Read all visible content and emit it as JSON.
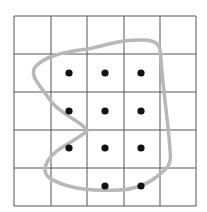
{
  "diagram": {
    "type": "grid-with-closed-curve",
    "grid": {
      "rows": 5,
      "cols": 5,
      "x_lines": [
        14,
        51,
        87,
        124,
        160,
        196
      ],
      "y_lines": [
        16,
        54,
        92,
        130,
        168,
        206
      ],
      "line_color": "#555555"
    },
    "dots": [
      {
        "x": 69,
        "y": 73
      },
      {
        "x": 105,
        "y": 73
      },
      {
        "x": 141,
        "y": 73
      },
      {
        "x": 69,
        "y": 111
      },
      {
        "x": 105,
        "y": 111
      },
      {
        "x": 141,
        "y": 111
      },
      {
        "x": 69,
        "y": 148
      },
      {
        "x": 105,
        "y": 148
      },
      {
        "x": 141,
        "y": 148
      },
      {
        "x": 105,
        "y": 186
      },
      {
        "x": 141,
        "y": 186
      }
    ],
    "dot_color": "#111111",
    "dot_count": 11,
    "curve": {
      "color": "#b8b8b8",
      "path": "M 88 49 C 110 44, 125 39, 145 40 C 162 41, 160 50, 161 60 C 163 90, 168 120, 170 150 C 172 165, 168 168, 155 178 C 145 186, 135 189, 120 190 C 100 191, 80 190, 65 185 C 50 180, 42 175, 46 165 C 50 150, 75 142, 87 131 C 84 122, 60 115, 50 100 C 40 85, 28 75, 36 66 C 45 57, 60 52, 88 49 Z"
    }
  }
}
